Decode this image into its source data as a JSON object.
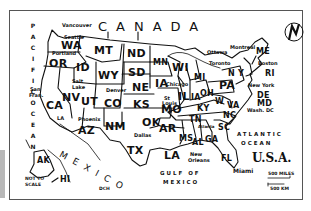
{
  "map": {
    "title": "U.S.A.",
    "country_north": "CANADA",
    "country_south": "MEXICO",
    "oceans": {
      "pacific": "PACIFIC OCEAN",
      "atlantic_1": "ATLANTIC",
      "atlantic_2": "OCEAN",
      "gulf_1": "GULF  OF",
      "gulf_2": "MEXICO"
    },
    "states": {
      "WA": "WA",
      "OR": "OR",
      "CA": "CA",
      "ID": "ID",
      "NV": "NV",
      "MT": "MT",
      "WY": "WY",
      "UT": "UT",
      "AZ": "AZ",
      "CO": "CO",
      "NM": "NM",
      "ND": "ND",
      "SD": "SD",
      "NE": "NE",
      "KS": "KS",
      "OK": "OK",
      "TX": "TX",
      "MN": "MN",
      "IA": "IA",
      "MO": "MO",
      "AR": "AR",
      "LA": "LA",
      "WI": "WI",
      "IL": "IL",
      "IN": "IA",
      "MI": "MI",
      "OH": "OH",
      "KY": "KY",
      "TN": "TN",
      "MS": "MS",
      "AL": "AL",
      "GA": "GA",
      "FL": "FL",
      "SC": "SC",
      "NC": "NC",
      "VA": "VA",
      "WV": "W",
      "PA": "PA",
      "NY": "N Y",
      "ME": "ME",
      "RI": "RI",
      "DE": "DE",
      "MD": "MD",
      "AK": "AK",
      "HI": "HI"
    },
    "cities": {
      "vancouver": "Vancouver",
      "seattle": "Seattle",
      "portland": "Portland",
      "san_francisco_1": "San",
      "san_francisco_2": "Fran.",
      "la": "LA",
      "salt_lake_1": "Salt",
      "salt_lake_2": "Lake",
      "denver": "Denver",
      "phoenix": "Phoenix",
      "dallas": "Dallas",
      "chicago": "Chicago",
      "st_louis_1": "St",
      "st_louis_2": "Louis",
      "ottawa": "Ottawa",
      "toronto": "Toronto",
      "montreal": "Montreal",
      "boston": "Boston",
      "new_york": "New York",
      "wash_dc": "Wash. DC",
      "atlanta": "Atlanta",
      "new_orleans_1": "New",
      "new_orleans_2": "Orleans",
      "miami": "Miami"
    },
    "notes": {
      "not_to_scale_1": "NOT TO",
      "not_to_scale_2": "SCALE",
      "signature": "DCH"
    },
    "scale": {
      "miles": "500 MILES",
      "km": "500 KM"
    },
    "compass": {
      "letter": "N",
      "icon": "north-arrow-icon"
    },
    "colors": {
      "ink": "#111111",
      "paper": "#ffffff",
      "frame": "#555555",
      "side_bar": "#b8b8b8"
    }
  }
}
